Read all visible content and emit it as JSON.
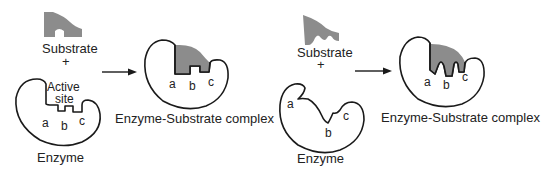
{
  "colors": {
    "substrate_fill": "#8c8c8c",
    "outline": "#1a1a1a",
    "text": "#222222",
    "background": "#ffffff"
  },
  "left_panel": {
    "model": "lock-and-key",
    "substrate_label": "Substrate",
    "plus_sign": "+",
    "active_site_label_line1": "Active",
    "active_site_label_line2": "site",
    "enzyme_label": "Enzyme",
    "site_labels": [
      "a",
      "b",
      "c"
    ],
    "complex_label": "Enzyme-Substrate complex",
    "complex_site_labels": [
      "a",
      "b",
      "c"
    ]
  },
  "right_panel": {
    "model": "induced-fit",
    "substrate_label": "Substrate",
    "plus_sign": "+",
    "enzyme_label": "Enzyme",
    "site_labels": [
      "a",
      "b",
      "c"
    ],
    "complex_label": "Enzyme-Substrate complex",
    "complex_site_labels": [
      "a",
      "b",
      "c"
    ]
  }
}
